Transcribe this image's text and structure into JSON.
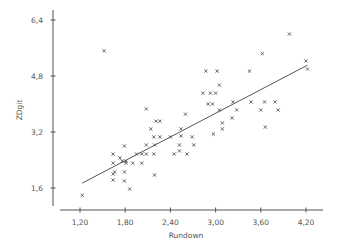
{
  "chart_data": {
    "type": "scatter",
    "title": "",
    "xlabel": "Rundown",
    "ylabel": "ZDgit",
    "xlim": [
      0.8,
      4.45
    ],
    "ylim": [
      1.12,
      6.7
    ],
    "x_ticks": [
      1.2,
      1.8,
      2.4,
      3.0,
      3.6,
      4.2
    ],
    "x_tick_labels": [
      "1,20",
      "1,80",
      "2,40",
      "3,00",
      "3,60",
      "4,20"
    ],
    "y_ticks": [
      1.6,
      3.2,
      4.8,
      6.4
    ],
    "y_tick_labels": [
      "1,6",
      "3,2",
      "4,8",
      "6,4"
    ],
    "grid": false,
    "legend": null,
    "marker": "x",
    "color": "#555555",
    "series": [
      {
        "name": "observations",
        "points": [
          [
            1.23,
            1.39
          ],
          [
            1.52,
            5.52
          ],
          [
            1.64,
            2.57
          ],
          [
            1.64,
            2.31
          ],
          [
            1.64,
            2.0
          ],
          [
            1.64,
            1.83
          ],
          [
            1.66,
            2.06
          ],
          [
            1.73,
            2.46
          ],
          [
            1.76,
            2.37
          ],
          [
            1.79,
            2.8
          ],
          [
            1.79,
            2.06
          ],
          [
            1.79,
            1.8
          ],
          [
            1.81,
            2.37
          ],
          [
            1.81,
            2.31
          ],
          [
            1.86,
            1.57
          ],
          [
            1.9,
            2.31
          ],
          [
            1.95,
            2.57
          ],
          [
            2.02,
            2.31
          ],
          [
            2.02,
            2.57
          ],
          [
            2.08,
            2.57
          ],
          [
            2.08,
            2.83
          ],
          [
            2.08,
            3.86
          ],
          [
            2.14,
            3.29
          ],
          [
            2.18,
            2.57
          ],
          [
            2.18,
            3.06
          ],
          [
            2.19,
            1.97
          ],
          [
            2.19,
            2.83
          ],
          [
            2.21,
            3.51
          ],
          [
            2.26,
            3.51
          ],
          [
            2.26,
            3.06
          ],
          [
            2.4,
            3.06
          ],
          [
            2.45,
            2.57
          ],
          [
            2.52,
            2.66
          ],
          [
            2.52,
            2.83
          ],
          [
            2.54,
            3.09
          ],
          [
            2.54,
            3.29
          ],
          [
            2.6,
            3.71
          ],
          [
            2.62,
            2.57
          ],
          [
            2.69,
            3.06
          ],
          [
            2.71,
            2.83
          ],
          [
            2.83,
            4.31
          ],
          [
            2.87,
            4.94
          ],
          [
            2.9,
            4.0
          ],
          [
            2.93,
            4.31
          ],
          [
            2.96,
            4.0
          ],
          [
            2.97,
            3.14
          ],
          [
            3.0,
            4.31
          ],
          [
            3.02,
            4.94
          ],
          [
            3.05,
            4.54
          ],
          [
            3.05,
            3.83
          ],
          [
            3.09,
            3.29
          ],
          [
            3.09,
            3.46
          ],
          [
            3.22,
            3.6
          ],
          [
            3.23,
            4.06
          ],
          [
            3.28,
            3.83
          ],
          [
            3.45,
            4.94
          ],
          [
            3.47,
            4.06
          ],
          [
            3.6,
            3.83
          ],
          [
            3.62,
            5.44
          ],
          [
            3.65,
            4.06
          ],
          [
            3.66,
            3.34
          ],
          [
            3.79,
            4.06
          ],
          [
            3.83,
            3.83
          ],
          [
            3.98,
            6.0
          ],
          [
            4.2,
            5.23
          ],
          [
            4.22,
            5.0
          ]
        ]
      }
    ],
    "regression_line": {
      "x": [
        1.23,
        4.22
      ],
      "y": [
        1.74,
        5.11
      ]
    }
  }
}
